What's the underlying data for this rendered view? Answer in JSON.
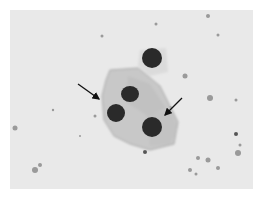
{
  "image": {
    "description": "Grayscale light micrograph of a cluster of epithelial cells with dark nuclei; two arrows point to cell borders",
    "colors": {
      "background": "#e9e9e9",
      "cytoplasm": "#c9c9c9",
      "nucleus": "#2a2a2a",
      "arrow": "#111111"
    },
    "nuclei": [
      {
        "cx": 142,
        "cy": 48,
        "rx": 10,
        "ry": 10
      },
      {
        "cx": 120,
        "cy": 84,
        "rx": 9,
        "ry": 8
      },
      {
        "cx": 106,
        "cy": 103,
        "rx": 9,
        "ry": 9
      },
      {
        "cx": 142,
        "cy": 117,
        "rx": 10,
        "ry": 10
      }
    ],
    "arrows": [
      {
        "x1": 68,
        "y1": 74,
        "x2": 90,
        "y2": 90
      },
      {
        "x1": 172,
        "y1": 88,
        "x2": 154,
        "y2": 106
      }
    ]
  }
}
